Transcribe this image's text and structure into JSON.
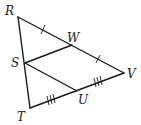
{
  "diagram": {
    "type": "geometry-triangle",
    "vertices": {
      "R": {
        "label": "R",
        "x": 18,
        "y": 17
      },
      "S": {
        "label": "S",
        "x": 25,
        "y": 63
      },
      "T": {
        "label": "T",
        "x": 30,
        "y": 108
      },
      "W": {
        "label": "W",
        "x": 72,
        "y": 45
      },
      "V": {
        "label": "V",
        "x": 124,
        "y": 73
      },
      "U": {
        "label": "U",
        "x": 77,
        "y": 91
      }
    },
    "labels": {
      "R": "R",
      "S": "S",
      "T": "T",
      "U": "U",
      "V": "V",
      "W": "W"
    },
    "segments": [
      "RV",
      "RT",
      "TV",
      "SW",
      "SU"
    ],
    "congruence_marks": [
      {
        "segments": [
          "RW",
          "WV"
        ],
        "ticks": 1
      },
      {
        "segments": [
          "TU",
          "UV"
        ],
        "ticks": 3
      }
    ],
    "colors": {
      "stroke": "#1a1a1a",
      "background": "#ffffff"
    }
  }
}
